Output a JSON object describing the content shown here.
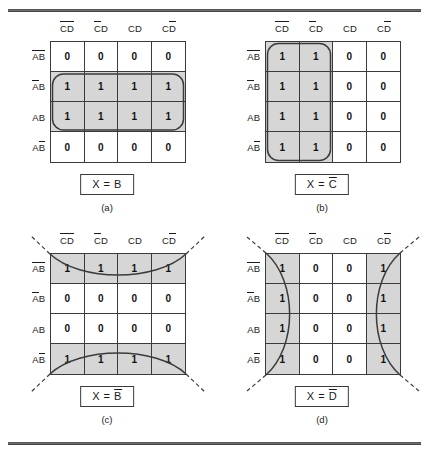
{
  "figure": {
    "columns_label_row": [
      "C̄D̄",
      "C̄D",
      "CD",
      "CD̄"
    ],
    "rows_label_col": [
      "ĀB̄",
      "ĀB",
      "AB",
      "AB̄"
    ],
    "shade_color": "#d6d6d6",
    "line_color": "#3b3b3b"
  },
  "panels": [
    {
      "id": "a",
      "caption": "(a)",
      "result": "X = B",
      "result_parts": {
        "lhs": "X",
        "eq": "=",
        "var": "B",
        "bar": false
      },
      "col_headers": [
        {
          "base": "C",
          "bar1": true,
          "second": "D",
          "bar2": true
        },
        {
          "base": "C",
          "bar1": true,
          "second": "D",
          "bar2": false
        },
        {
          "base": "C",
          "bar1": false,
          "second": "D",
          "bar2": false
        },
        {
          "base": "C",
          "bar1": false,
          "second": "D",
          "bar2": true
        }
      ],
      "row_headers": [
        {
          "base": "A",
          "bar1": true,
          "second": "B",
          "bar2": true
        },
        {
          "base": "A",
          "bar1": true,
          "second": "B",
          "bar2": false
        },
        {
          "base": "A",
          "bar1": false,
          "second": "B",
          "bar2": false
        },
        {
          "base": "A",
          "bar1": false,
          "second": "B",
          "bar2": true
        }
      ],
      "cells": [
        [
          "0",
          "0",
          "0",
          "0"
        ],
        [
          "1",
          "1",
          "1",
          "1"
        ],
        [
          "1",
          "1",
          "1",
          "1"
        ],
        [
          "0",
          "0",
          "0",
          "0"
        ]
      ],
      "shaded": [
        [
          false,
          false,
          false,
          false
        ],
        [
          true,
          true,
          true,
          true
        ],
        [
          true,
          true,
          true,
          true
        ],
        [
          false,
          false,
          false,
          false
        ]
      ],
      "group_style": "rounded-rect",
      "wrap": "none"
    },
    {
      "id": "b",
      "caption": "(b)",
      "result": "X = C̄",
      "result_parts": {
        "lhs": "X",
        "eq": "=",
        "var": "C",
        "bar": true
      },
      "col_headers": [
        {
          "base": "C",
          "bar1": true,
          "second": "D",
          "bar2": true
        },
        {
          "base": "C",
          "bar1": true,
          "second": "D",
          "bar2": false
        },
        {
          "base": "C",
          "bar1": false,
          "second": "D",
          "bar2": false
        },
        {
          "base": "C",
          "bar1": false,
          "second": "D",
          "bar2": true
        }
      ],
      "row_headers": [
        {
          "base": "A",
          "bar1": true,
          "second": "B",
          "bar2": true
        },
        {
          "base": "A",
          "bar1": true,
          "second": "B",
          "bar2": false
        },
        {
          "base": "A",
          "bar1": false,
          "second": "B",
          "bar2": false
        },
        {
          "base": "A",
          "bar1": false,
          "second": "B",
          "bar2": true
        }
      ],
      "cells": [
        [
          "1",
          "1",
          "0",
          "0"
        ],
        [
          "1",
          "1",
          "0",
          "0"
        ],
        [
          "1",
          "1",
          "0",
          "0"
        ],
        [
          "1",
          "1",
          "0",
          "0"
        ]
      ],
      "shaded": [
        [
          true,
          true,
          false,
          false
        ],
        [
          true,
          true,
          false,
          false
        ],
        [
          true,
          true,
          false,
          false
        ],
        [
          true,
          true,
          false,
          false
        ]
      ],
      "group_style": "rounded-rect",
      "wrap": "none"
    },
    {
      "id": "c",
      "caption": "(c)",
      "result": "X = B̄",
      "result_parts": {
        "lhs": "X",
        "eq": "=",
        "var": "B",
        "bar": true
      },
      "col_headers": [
        {
          "base": "C",
          "bar1": true,
          "second": "D",
          "bar2": true
        },
        {
          "base": "C",
          "bar1": true,
          "second": "D",
          "bar2": false
        },
        {
          "base": "C",
          "bar1": false,
          "second": "D",
          "bar2": false
        },
        {
          "base": "C",
          "bar1": false,
          "second": "D",
          "bar2": true
        }
      ],
      "row_headers": [
        {
          "base": "A",
          "bar1": true,
          "second": "B",
          "bar2": true
        },
        {
          "base": "A",
          "bar1": true,
          "second": "B",
          "bar2": false
        },
        {
          "base": "A",
          "bar1": false,
          "second": "B",
          "bar2": false
        },
        {
          "base": "A",
          "bar1": false,
          "second": "B",
          "bar2": true
        }
      ],
      "cells": [
        [
          "1",
          "1",
          "1",
          "1"
        ],
        [
          "0",
          "0",
          "0",
          "0"
        ],
        [
          "0",
          "0",
          "0",
          "0"
        ],
        [
          "1",
          "1",
          "1",
          "1"
        ]
      ],
      "shaded": [
        [
          true,
          true,
          true,
          true
        ],
        [
          false,
          false,
          false,
          false
        ],
        [
          false,
          false,
          false,
          false
        ],
        [
          true,
          true,
          true,
          true
        ]
      ],
      "group_style": "wrap-curve-horizontal",
      "wrap": "top-bottom"
    },
    {
      "id": "d",
      "caption": "(d)",
      "result": "X = D̄",
      "result_parts": {
        "lhs": "X",
        "eq": "=",
        "var": "D",
        "bar": true
      },
      "col_headers": [
        {
          "base": "C",
          "bar1": true,
          "second": "D",
          "bar2": true
        },
        {
          "base": "C",
          "bar1": true,
          "second": "D",
          "bar2": false
        },
        {
          "base": "C",
          "bar1": false,
          "second": "D",
          "bar2": false
        },
        {
          "base": "C",
          "bar1": false,
          "second": "D",
          "bar2": true
        }
      ],
      "row_headers": [
        {
          "base": "A",
          "bar1": true,
          "second": "B",
          "bar2": true
        },
        {
          "base": "A",
          "bar1": true,
          "second": "B",
          "bar2": false
        },
        {
          "base": "A",
          "bar1": false,
          "second": "B",
          "bar2": false
        },
        {
          "base": "A",
          "bar1": false,
          "second": "B",
          "bar2": true
        }
      ],
      "cells": [
        [
          "1",
          "0",
          "0",
          "1"
        ],
        [
          "1",
          "0",
          "0",
          "1"
        ],
        [
          "1",
          "0",
          "0",
          "1"
        ],
        [
          "1",
          "0",
          "0",
          "1"
        ]
      ],
      "shaded": [
        [
          true,
          false,
          false,
          true
        ],
        [
          true,
          false,
          false,
          true
        ],
        [
          true,
          false,
          false,
          true
        ],
        [
          true,
          false,
          false,
          true
        ]
      ],
      "group_style": "wrap-curve-vertical",
      "wrap": "left-right"
    }
  ]
}
